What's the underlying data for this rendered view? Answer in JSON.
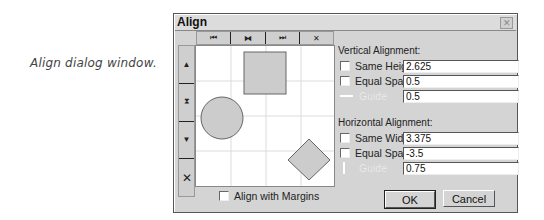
{
  "caption": "Align dialog window.",
  "dialog": {
    "title": "Align",
    "close_glyph": "✕"
  },
  "horizontal_toolbar": [
    {
      "name": "align-left",
      "glyph": "⏮"
    },
    {
      "name": "align-center-horizontal",
      "glyph": "⧓"
    },
    {
      "name": "align-right",
      "glyph": "⏭"
    },
    {
      "name": "no-horizontal-align",
      "glyph": "✕"
    }
  ],
  "vertical_toolbar": [
    {
      "name": "align-top",
      "glyph": "▲"
    },
    {
      "name": "align-middle-vertical",
      "glyph": "⧗"
    },
    {
      "name": "align-bottom",
      "glyph": "▼"
    },
    {
      "name": "no-vertical-align",
      "glyph": "✕"
    }
  ],
  "vertical_alignment": {
    "label": "Vertical Alignment:",
    "same_height": {
      "label": "Same Height",
      "checked": false,
      "value": "2.625"
    },
    "equal_spacing": {
      "label": "Equal Spacing",
      "checked": false,
      "value": "0.5"
    },
    "guide": {
      "label": "Guide",
      "enabled": false,
      "value": "0.5"
    }
  },
  "horizontal_alignment": {
    "label": "Horizontal Alignment:",
    "same_width": {
      "label": "Same Width",
      "checked": false,
      "value": "3.375"
    },
    "equal_spacing": {
      "label": "Equal Spacing",
      "checked": false,
      "value": "-3.5"
    },
    "guide": {
      "label": "Guide",
      "enabled": false,
      "value": "0.75"
    }
  },
  "align_with_margins": {
    "label": "Align with Margins",
    "checked": false
  },
  "buttons": {
    "ok": "OK",
    "cancel": "Cancel"
  }
}
